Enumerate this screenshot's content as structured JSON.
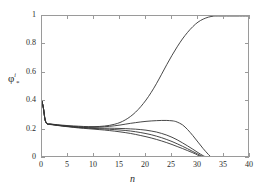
{
  "chart_data": {
    "type": "line",
    "title": "",
    "xlabel": "n",
    "ylabel_base": "φ",
    "ylabel_sub": "*",
    "ylabel_sup": "i",
    "xlim": [
      0,
      40
    ],
    "ylim": [
      0,
      1
    ],
    "xticks": [
      0,
      5,
      10,
      15,
      20,
      25,
      30,
      35,
      40
    ],
    "xticklabels": [
      "0",
      "5",
      "10",
      "15",
      "20",
      "25",
      "30",
      "35",
      "40"
    ],
    "yticks": [
      0,
      0.2,
      0.4,
      0.6,
      0.8,
      1
    ],
    "yticklabels": [
      "0",
      "0.2",
      "0.4",
      "0.6",
      "0.8",
      "1"
    ],
    "grid": false,
    "legend": "none",
    "line_color": "#333333",
    "axis_color": "#9a9a9a",
    "series": [
      {
        "name": "curve-1-rises-to-one",
        "x": [
          0,
          0.3,
          0.6,
          1,
          1.5,
          2,
          3,
          4,
          5,
          6,
          7,
          8,
          9,
          10,
          11,
          12,
          13,
          14,
          15,
          16,
          17,
          18,
          19,
          20,
          21,
          22,
          23,
          24,
          25,
          26,
          27,
          28,
          29,
          30,
          31,
          32,
          33,
          34,
          36,
          38,
          40
        ],
        "y": [
          0.4,
          0.345,
          0.268,
          0.243,
          0.24,
          0.238,
          0.234,
          0.231,
          0.228,
          0.226,
          0.224,
          0.222,
          0.221,
          0.221,
          0.222,
          0.225,
          0.23,
          0.238,
          0.25,
          0.268,
          0.292,
          0.323,
          0.362,
          0.408,
          0.462,
          0.523,
          0.59,
          0.658,
          0.723,
          0.783,
          0.838,
          0.885,
          0.925,
          0.957,
          0.978,
          0.992,
          0.999,
          1.0,
          1.0,
          1.0,
          1.0
        ]
      },
      {
        "name": "curve-2-peaks-then-falls",
        "x": [
          0,
          0.3,
          0.6,
          1,
          1.5,
          2,
          3,
          4,
          5,
          6,
          7,
          8,
          9,
          10,
          11,
          12,
          13,
          14,
          15,
          16,
          17,
          18,
          19,
          20,
          21,
          22,
          23,
          24,
          25,
          25.5,
          26,
          27,
          28,
          29,
          30,
          31,
          32,
          32.6,
          33,
          34,
          36,
          38,
          40
        ],
        "y": [
          0.4,
          0.345,
          0.268,
          0.242,
          0.239,
          0.237,
          0.232,
          0.228,
          0.225,
          0.222,
          0.22,
          0.218,
          0.217,
          0.217,
          0.218,
          0.22,
          0.223,
          0.227,
          0.232,
          0.238,
          0.244,
          0.249,
          0.254,
          0.258,
          0.261,
          0.263,
          0.2645,
          0.2645,
          0.262,
          0.259,
          0.253,
          0.234,
          0.2,
          0.158,
          0.112,
          0.066,
          0.025,
          0.005,
          0.0,
          0.0,
          0.0,
          0.0,
          0.0
        ]
      },
      {
        "name": "curve-3-decline",
        "x": [
          0,
          0.3,
          0.6,
          1,
          1.5,
          2,
          3,
          4,
          5,
          6,
          7,
          8,
          9,
          10,
          11,
          12,
          13,
          14,
          15,
          16,
          17,
          18,
          19,
          20,
          21,
          22,
          23,
          24,
          25,
          26,
          27,
          28,
          29,
          30,
          31,
          31.8,
          32.2,
          33,
          35,
          37,
          40
        ],
        "y": [
          0.4,
          0.345,
          0.268,
          0.241,
          0.238,
          0.236,
          0.231,
          0.227,
          0.223,
          0.22,
          0.217,
          0.215,
          0.213,
          0.212,
          0.211,
          0.21,
          0.21,
          0.209,
          0.208,
          0.207,
          0.205,
          0.203,
          0.2,
          0.196,
          0.19,
          0.183,
          0.173,
          0.161,
          0.146,
          0.128,
          0.107,
          0.085,
          0.062,
          0.038,
          0.016,
          0.003,
          0.0,
          0.0,
          0.0,
          0.0,
          0.0
        ]
      },
      {
        "name": "curve-4-decline",
        "x": [
          0,
          0.3,
          0.6,
          1,
          1.5,
          2,
          3,
          4,
          5,
          6,
          7,
          8,
          9,
          10,
          11,
          12,
          13,
          14,
          15,
          16,
          17,
          18,
          19,
          20,
          21,
          22,
          23,
          24,
          25,
          26,
          27,
          28,
          29,
          30,
          31,
          31.5,
          32,
          33,
          35,
          37,
          40
        ],
        "y": [
          0.4,
          0.345,
          0.268,
          0.24,
          0.237,
          0.235,
          0.23,
          0.226,
          0.222,
          0.218,
          0.215,
          0.212,
          0.21,
          0.208,
          0.206,
          0.204,
          0.202,
          0.2,
          0.197,
          0.194,
          0.19,
          0.185,
          0.179,
          0.172,
          0.164,
          0.154,
          0.143,
          0.13,
          0.116,
          0.1,
          0.083,
          0.065,
          0.046,
          0.027,
          0.009,
          0.002,
          0.0,
          0.0,
          0.0,
          0.0,
          0.0
        ]
      },
      {
        "name": "curve-5-decline",
        "x": [
          0,
          0.3,
          0.6,
          1,
          1.5,
          2,
          3,
          4,
          5,
          6,
          7,
          8,
          9,
          10,
          11,
          12,
          13,
          14,
          15,
          16,
          17,
          18,
          19,
          20,
          21,
          22,
          23,
          24,
          25,
          26,
          27,
          28,
          29,
          30,
          30.8,
          31.3,
          32,
          33,
          35,
          37,
          40
        ],
        "y": [
          0.4,
          0.345,
          0.268,
          0.239,
          0.236,
          0.234,
          0.229,
          0.224,
          0.22,
          0.216,
          0.212,
          0.209,
          0.206,
          0.203,
          0.2,
          0.197,
          0.193,
          0.189,
          0.184,
          0.179,
          0.173,
          0.166,
          0.158,
          0.15,
          0.141,
          0.131,
          0.12,
          0.108,
          0.095,
          0.081,
          0.067,
          0.052,
          0.037,
          0.02,
          0.007,
          0.001,
          0.0,
          0.0,
          0.0,
          0.0,
          0.0
        ]
      }
    ]
  }
}
